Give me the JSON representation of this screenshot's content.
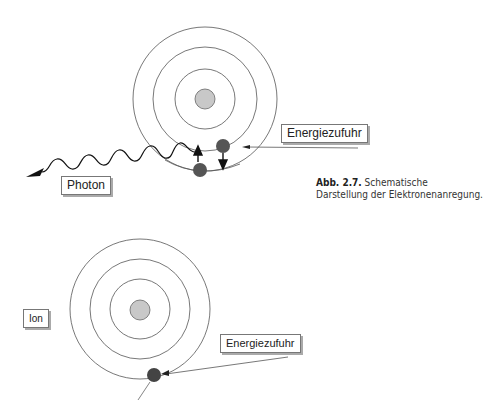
{
  "figure": {
    "top_diagram": {
      "energy_label": "Energiezufuhr",
      "photon_label": "Photon"
    },
    "bottom_diagram": {
      "ion_label": "Ion",
      "energy_label": "Energiezufuhr"
    },
    "caption": {
      "number": "Abb. 2.7.",
      "line1": "Schematische",
      "line2": "Darstellung der Elektronenanregung."
    },
    "colors": {
      "nucleus": "#c8c8c8",
      "electron": "#555555",
      "orbit": "#555555"
    }
  }
}
